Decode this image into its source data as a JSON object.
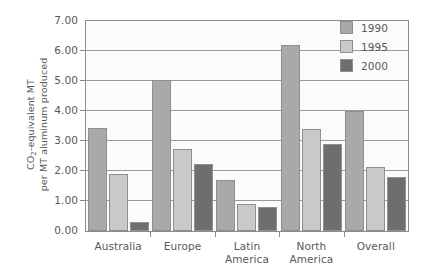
{
  "chart_data": {
    "type": "bar",
    "title": "",
    "xlabel": "",
    "ylabel_line1": "CO2-equivalent MT",
    "ylabel_line2": "per MT aluminum produced",
    "categories": [
      "Australia",
      "Europe",
      "Latin America",
      "North America",
      "Overall"
    ],
    "category_lines": [
      [
        "Australia"
      ],
      [
        "Europe"
      ],
      [
        "Latin",
        "America"
      ],
      [
        "North",
        "America"
      ],
      [
        "Overall"
      ]
    ],
    "series": [
      {
        "name": "1990",
        "color": "#a9a9ab",
        "values": [
          3.45,
          5.05,
          1.7,
          6.2,
          4.0
        ]
      },
      {
        "name": "1995",
        "color": "#c9c9cb",
        "values": [
          1.9,
          2.75,
          0.9,
          3.4,
          2.15
        ]
      },
      {
        "name": "2000",
        "color": "#6e6e70",
        "values": [
          0.3,
          2.25,
          0.8,
          2.9,
          1.8
        ]
      }
    ],
    "ylim": [
      0.0,
      7.0
    ],
    "ytick_step": 1.0,
    "ytick_labels": [
      "7.00",
      "6.00",
      "5.00",
      "4.00",
      "3.00",
      "2.00",
      "1.00",
      "0.00"
    ],
    "ytick_values": [
      7.0,
      6.0,
      5.0,
      4.0,
      3.0,
      2.0,
      1.0,
      0.0
    ],
    "grid": true,
    "legend_position": "top-right",
    "legend_entries": [
      "1990",
      "1995",
      "2000"
    ],
    "plot_background": "#fbfbfb",
    "axis_color": "#8b8b8d",
    "grid_color": "#9a9a9c",
    "text_color": "#58585a"
  }
}
